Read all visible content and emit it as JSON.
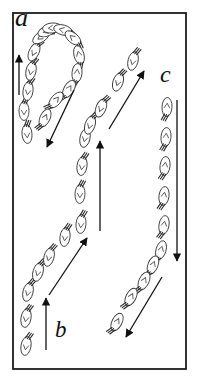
{
  "figure": {
    "canvas": {
      "width": 198,
      "height": 389,
      "background": "#ffffff"
    },
    "frame": {
      "x": 13,
      "y": 13,
      "width": 173,
      "height": 356,
      "stroke": "#1c1c1c",
      "stroke_width": 1.8,
      "fill": "#ffffff"
    },
    "labels": {
      "a": {
        "text": "a",
        "x": 15,
        "y": 5,
        "font_size": 26
      },
      "b": {
        "text": "b",
        "x": 55,
        "y": 318,
        "font_size": 23
      },
      "c": {
        "text": "c",
        "x": 160,
        "y": 62,
        "font_size": 24
      }
    },
    "style": {
      "organism_fill": "#ffffff",
      "organism_stroke": "#3a3a3a",
      "marking_stroke": "#555555",
      "antenna_stroke": "#2a2a2a",
      "arrow_color": "#111111"
    },
    "arrows": [
      {
        "id": "a-left-up",
        "x1": 19,
        "y1": 95,
        "x2": 19,
        "y2": 55
      },
      {
        "id": "a-turn-down-left",
        "x1": 74,
        "y1": 90,
        "x2": 47,
        "y2": 147
      },
      {
        "id": "mid-up-right",
        "x1": 109,
        "y1": 129,
        "x2": 144,
        "y2": 71
      },
      {
        "id": "mid-up",
        "x1": 100,
        "y1": 231,
        "x2": 100,
        "y2": 141
      },
      {
        "id": "b-up-right",
        "x1": 49,
        "y1": 295,
        "x2": 87,
        "y2": 238
      },
      {
        "id": "b-up",
        "x1": 46,
        "y1": 350,
        "x2": 46,
        "y2": 298
      },
      {
        "id": "c-down",
        "x1": 177,
        "y1": 100,
        "x2": 177,
        "y2": 261
      },
      {
        "id": "c-turn-down-left",
        "x1": 162,
        "y1": 277,
        "x2": 126,
        "y2": 337
      }
    ],
    "groups": [
      {
        "id": "hook-a",
        "organisms": [
          [
            27,
            134,
            355
          ],
          [
            24,
            111,
            0
          ],
          [
            28,
            91,
            8
          ],
          [
            31,
            71,
            12
          ],
          [
            34,
            52,
            25
          ],
          [
            41,
            37,
            55
          ],
          [
            47,
            31,
            68
          ],
          [
            52,
            28,
            85
          ],
          [
            63,
            30,
            105
          ],
          [
            73,
            38,
            130
          ],
          [
            79,
            55,
            165
          ],
          [
            77,
            73,
            185
          ],
          [
            69,
            89,
            210
          ],
          [
            56,
            100,
            220
          ],
          [
            45,
            118,
            205
          ]
        ]
      },
      {
        "id": "middle-column",
        "organisms": [
          [
            81,
            224,
            5
          ],
          [
            80,
            194,
            2
          ],
          [
            82,
            166,
            8
          ],
          [
            85,
            138,
            12
          ],
          [
            90,
            125,
            18
          ],
          [
            101,
            108,
            22
          ],
          [
            118,
            82,
            18
          ],
          [
            133,
            61,
            14
          ]
        ]
      },
      {
        "id": "right-column-c",
        "organisms": [
          [
            167,
            107,
            183
          ],
          [
            166,
            137,
            185
          ],
          [
            165,
            166,
            187
          ],
          [
            164,
            196,
            188
          ],
          [
            164,
            225,
            190
          ],
          [
            161,
            250,
            196
          ],
          [
            153,
            265,
            202
          ],
          [
            144,
            281,
            205
          ],
          [
            131,
            297,
            207
          ],
          [
            117,
            322,
            207
          ]
        ]
      },
      {
        "id": "bottom-column-b",
        "organisms": [
          [
            26,
            346,
            10
          ],
          [
            26,
            318,
            10
          ],
          [
            28,
            292,
            14
          ],
          [
            38,
            272,
            16
          ],
          [
            49,
            257,
            15
          ],
          [
            65,
            237,
            8
          ]
        ]
      }
    ]
  }
}
